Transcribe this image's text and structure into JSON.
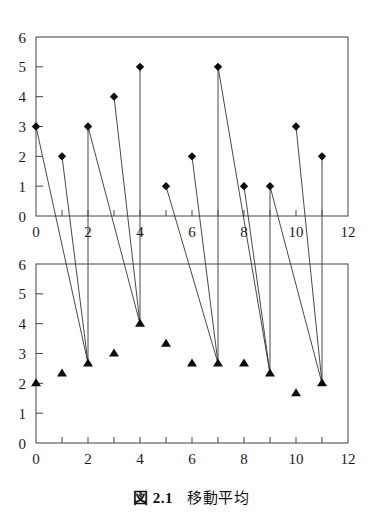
{
  "figure": {
    "caption_prefix": "図 2.1",
    "caption_text": "移動平均",
    "caption_full": "図 2.1　移動平均"
  },
  "chart_data": [
    {
      "type": "scatter",
      "id": "top-series-raw",
      "title": "",
      "xlabel": "",
      "ylabel": "",
      "marker": "diamond",
      "x": [
        0,
        1,
        2,
        3,
        4,
        5,
        6,
        7,
        8,
        9,
        10,
        11
      ],
      "values": [
        3,
        2,
        3,
        4,
        5,
        1,
        2,
        5,
        1,
        1,
        3,
        2
      ],
      "xlim": [
        0,
        12
      ],
      "ylim": [
        0,
        6
      ],
      "xticks": [
        0,
        1,
        2,
        3,
        4,
        5,
        6,
        7,
        8,
        9,
        10,
        11,
        12
      ],
      "xtick_labels": [
        "0",
        "",
        "2",
        "",
        "4",
        "",
        "6",
        "",
        "8",
        "",
        "10",
        "",
        "12"
      ],
      "yticks": [
        0,
        1,
        2,
        3,
        4,
        5,
        6
      ],
      "ytick_labels": [
        "0",
        "1",
        "2",
        "3",
        "4",
        "5",
        "6"
      ],
      "grid": false,
      "legend": "none"
    },
    {
      "type": "scatter",
      "id": "bottom-series-moving-average",
      "title": "",
      "xlabel": "",
      "ylabel": "",
      "marker": "triangle",
      "x": [
        0,
        1,
        2,
        3,
        4,
        5,
        6,
        7,
        8,
        9,
        10,
        11
      ],
      "values": [
        2.0,
        2.33,
        2.67,
        3.0,
        4.0,
        3.33,
        2.67,
        2.67,
        2.67,
        2.33,
        1.67,
        2.0
      ],
      "xlim": [
        0,
        12
      ],
      "ylim": [
        0,
        6
      ],
      "xticks": [
        0,
        1,
        2,
        3,
        4,
        5,
        6,
        7,
        8,
        9,
        10,
        11,
        12
      ],
      "xtick_labels": [
        "0",
        "",
        "2",
        "",
        "4",
        "",
        "6",
        "",
        "8",
        "",
        "10",
        "",
        "12"
      ],
      "yticks": [
        0,
        1,
        2,
        3,
        4,
        5,
        6
      ],
      "ytick_labels": [
        "0",
        "1",
        "2",
        "3",
        "4",
        "5",
        "6"
      ],
      "grid": false,
      "legend": "none"
    }
  ],
  "connectors": [
    {
      "from_x": 0,
      "from_y": 3,
      "to_x": 2,
      "to_y": 2.67
    },
    {
      "from_x": 1,
      "from_y": 2,
      "to_x": 2,
      "to_y": 2.67
    },
    {
      "from_x": 2,
      "from_y": 3,
      "to_x": 2,
      "to_y": 2.67
    },
    {
      "from_x": 2,
      "from_y": 3,
      "to_x": 4,
      "to_y": 4.0
    },
    {
      "from_x": 3,
      "from_y": 4,
      "to_x": 4,
      "to_y": 4.0
    },
    {
      "from_x": 4,
      "from_y": 5,
      "to_x": 4,
      "to_y": 4.0
    },
    {
      "from_x": 5,
      "from_y": 1,
      "to_x": 7,
      "to_y": 2.67
    },
    {
      "from_x": 6,
      "from_y": 2,
      "to_x": 7,
      "to_y": 2.67
    },
    {
      "from_x": 7,
      "from_y": 5,
      "to_x": 7,
      "to_y": 2.67
    },
    {
      "from_x": 7,
      "from_y": 5,
      "to_x": 9,
      "to_y": 2.33
    },
    {
      "from_x": 8,
      "from_y": 1,
      "to_x": 9,
      "to_y": 2.33
    },
    {
      "from_x": 9,
      "from_y": 1,
      "to_x": 9,
      "to_y": 2.33
    },
    {
      "from_x": 9,
      "from_y": 1,
      "to_x": 11,
      "to_y": 2.0
    },
    {
      "from_x": 10,
      "from_y": 3,
      "to_x": 11,
      "to_y": 2.0
    },
    {
      "from_x": 11,
      "from_y": 2,
      "to_x": 11,
      "to_y": 2.0
    }
  ],
  "style": {
    "marker_color": "#0d0d0d",
    "axis_color": "#444444",
    "line_color": "#333333",
    "background": "#ffffff"
  }
}
